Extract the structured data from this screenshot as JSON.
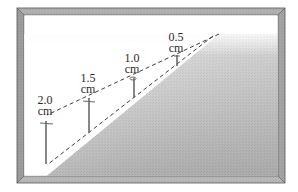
{
  "diagram": {
    "colors": {
      "frame": "#a8a8a8",
      "frame_dark": "#5a5a5a",
      "frame_light": "#d8d8d8",
      "background_top": "#ffffff",
      "gradient_light": "#e4e4e4",
      "gradient_dark": "#8a8a8a",
      "wedge": "#ffffff",
      "dashed_line": "#444444",
      "pin": "#6a6a6a",
      "text": "#2a2a2a"
    },
    "pins": [
      {
        "value": "2.0",
        "unit": "cm"
      },
      {
        "value": "1.5",
        "unit": "cm"
      },
      {
        "value": "1.0",
        "unit": "cm"
      },
      {
        "value": "0.5",
        "unit": "cm"
      }
    ]
  }
}
